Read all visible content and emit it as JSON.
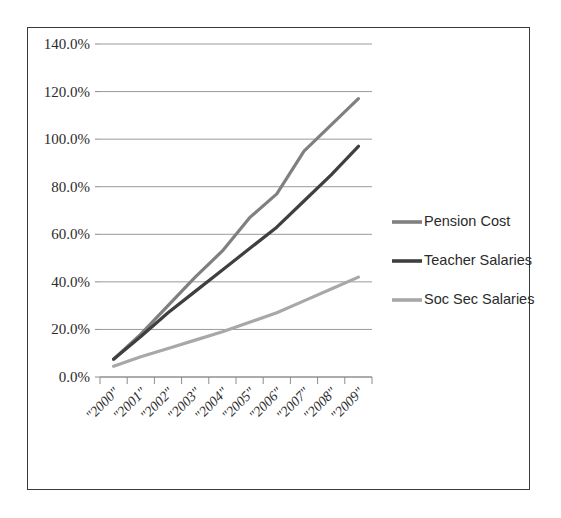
{
  "chart_data": {
    "type": "line",
    "title": "",
    "subtitle": "",
    "xlabel": "",
    "ylabel": "",
    "ylim": [
      0,
      140
    ],
    "ytick_labels": [
      "0.0%",
      "20.0%",
      "40.0%",
      "60.0%",
      "80.0%",
      "100.0%",
      "120.0%",
      "140.0%"
    ],
    "ytick_values": [
      0,
      20,
      40,
      60,
      80,
      100,
      120,
      140
    ],
    "grid": true,
    "legend_position": "right",
    "categories": [
      "\"2000\"",
      "\"2001\"",
      "\"2002\"",
      "\"2003\"",
      "\"2004\"",
      "\"2005\"",
      "\"2006\"",
      "\"2007\"",
      "\"2008\"",
      "\"2009\""
    ],
    "series": [
      {
        "name": "Pension Cost",
        "color": "#808080",
        "values": [
          7.5,
          18.0,
          30.0,
          42.0,
          53.0,
          67.0,
          77.0,
          95.0,
          106.0,
          117.0
        ]
      },
      {
        "name": "Teacher Salaries",
        "color": "#3f3f3f",
        "values": [
          7.5,
          17.0,
          27.0,
          36.0,
          45.0,
          54.0,
          63.0,
          74.0,
          85.0,
          97.0
        ]
      },
      {
        "name": "Soc Sec Salaries",
        "color": "#a8a8a8",
        "values": [
          4.5,
          8.5,
          12.0,
          15.5,
          19.0,
          23.0,
          27.0,
          32.0,
          37.0,
          42.0
        ]
      }
    ]
  },
  "legend": {
    "items": [
      {
        "label": "Pension Cost",
        "color": "#808080"
      },
      {
        "label": "Teacher Salaries",
        "color": "#3f3f3f"
      },
      {
        "label": "Soc Sec Salaries",
        "color": "#a8a8a8"
      }
    ]
  },
  "frame": {
    "border_color": "#3a3a3a",
    "background": "#ffffff"
  }
}
